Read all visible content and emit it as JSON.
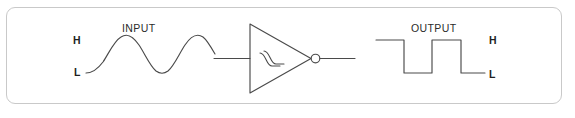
{
  "figure": {
    "kind": "schematic-diagram",
    "canvas": {
      "width": 575,
      "height": 118
    },
    "frame": {
      "border_color": "#c9c9c9",
      "background": "#ffffff",
      "corner_radius": 9
    },
    "stroke_color": "#4a4a4a",
    "text_color": "#2b2b2b"
  },
  "input_section": {
    "title": "INPUT",
    "high_label": "H",
    "low_label": "L",
    "waveform": "sine",
    "cycles": 2
  },
  "gate_section": {
    "symbol": "schmitt-trigger-inverter",
    "has_inversion_bubble": true,
    "hysteresis_glyph": true
  },
  "output_section": {
    "title": "OUTPUT",
    "high_label": "H",
    "low_label": "L",
    "waveform": "square",
    "levels": [
      "H",
      "L",
      "H",
      "L"
    ]
  }
}
